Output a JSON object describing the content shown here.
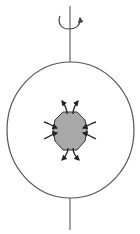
{
  "diagram": {
    "colors": {
      "background": "#ffffff",
      "stroke": "#555555",
      "axis": "#666666",
      "blob_fill": "#a8a8a8",
      "arrow": "#222222"
    },
    "elements": {
      "rotation_axis": {
        "x": 70,
        "top": 6,
        "bottom": 230
      },
      "rotation_arrow": {
        "direction": "counterclockwise-from-above"
      },
      "outer_sphere": {
        "cx": 70.5,
        "cy": 130,
        "rx": 63.5,
        "ry": 68
      },
      "inner_body": {
        "shape": "octagon",
        "fill": "gray"
      },
      "arrows": {
        "poles": "outward",
        "equator": "inward"
      }
    }
  }
}
